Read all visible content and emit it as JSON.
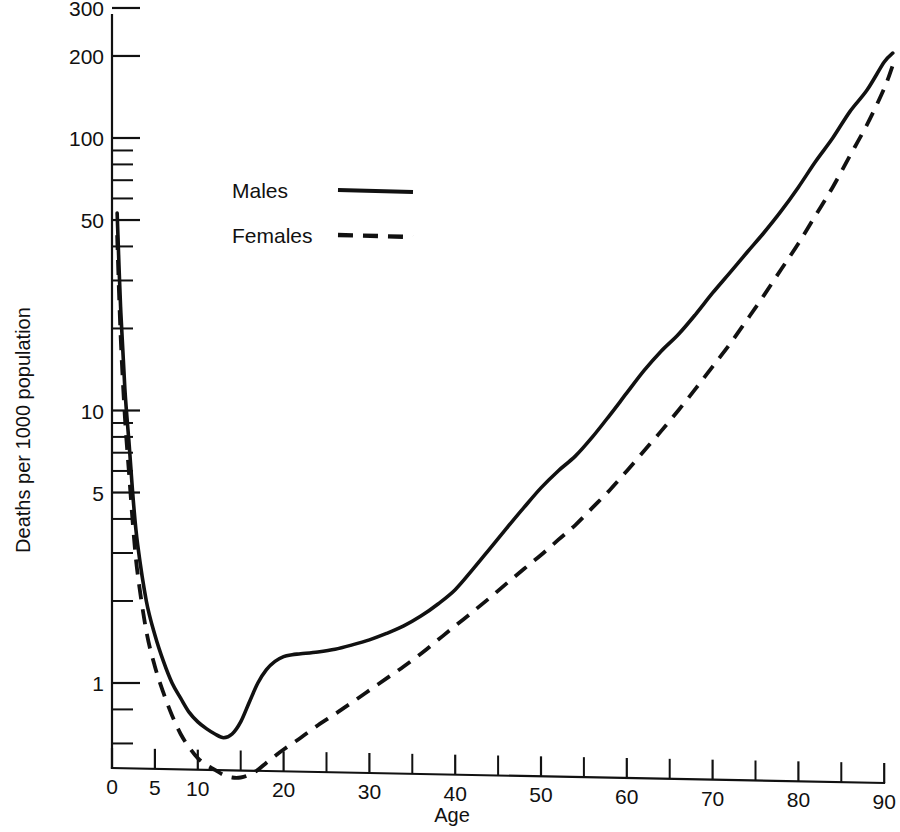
{
  "chart_data": {
    "type": "line",
    "title": "",
    "xlabel": "Age",
    "ylabel": "Deaths per 1000 population",
    "yscale": "log",
    "xscale": "linear",
    "xlim": [
      0,
      91
    ],
    "ylim": [
      0.4,
      330
    ],
    "grid": false,
    "legend_position": "upper-left-inside",
    "x_ticks_major": [
      0,
      5,
      10,
      20,
      30,
      40,
      50,
      60,
      70,
      80,
      90
    ],
    "x_tick_labels": [
      "0",
      "5",
      "10",
      "20",
      "30",
      "40",
      "50",
      "60",
      "70",
      "80",
      "90"
    ],
    "x_ticks_minor": [
      15,
      25,
      35,
      45,
      55,
      65,
      75,
      85
    ],
    "y_ticks_major": [
      1,
      5,
      10,
      50,
      100,
      200,
      300
    ],
    "y_tick_labels": [
      "1",
      "5",
      "10",
      "50",
      "100",
      "200",
      "300"
    ],
    "y_ticks_minor": [
      0.6,
      0.8,
      2,
      3,
      4,
      6,
      7,
      8,
      9,
      20,
      30,
      40,
      60,
      70,
      80,
      90
    ],
    "series": [
      {
        "name": "Males",
        "style": "solid",
        "color": "#111111",
        "x": [
          0.6,
          1,
          1.5,
          2,
          2.5,
          3,
          4,
          5,
          6,
          7,
          8,
          9,
          10,
          11,
          12,
          13,
          14,
          15,
          16,
          17,
          18,
          19,
          20,
          21,
          22,
          24,
          26,
          28,
          30,
          32,
          34,
          36,
          38,
          40,
          42,
          44,
          46,
          48,
          50,
          52,
          54,
          56,
          58,
          60,
          62,
          64,
          66,
          68,
          70,
          72,
          74,
          76,
          78,
          80,
          82,
          84,
          86,
          88,
          90,
          91
        ],
        "y": [
          53,
          24,
          12,
          7.5,
          4.6,
          3.2,
          2.0,
          1.5,
          1.2,
          1.0,
          0.88,
          0.78,
          0.72,
          0.68,
          0.65,
          0.63,
          0.65,
          0.72,
          0.85,
          1.0,
          1.12,
          1.2,
          1.25,
          1.27,
          1.28,
          1.3,
          1.33,
          1.38,
          1.44,
          1.52,
          1.62,
          1.76,
          1.95,
          2.2,
          2.6,
          3.1,
          3.7,
          4.4,
          5.2,
          6.0,
          6.8,
          8.0,
          9.6,
          11.6,
          14.0,
          16.5,
          19.0,
          22.5,
          27.0,
          32.0,
          38.0,
          45.0,
          54.0,
          66.0,
          82.0,
          100.0,
          125.0,
          150.0,
          190.0,
          205.0
        ]
      },
      {
        "name": "Females",
        "style": "dashed",
        "color": "#111111",
        "x": [
          0.6,
          1,
          1.5,
          2,
          2.5,
          3,
          4,
          5,
          6,
          7,
          8,
          9,
          10,
          11,
          12,
          13,
          14,
          15,
          16,
          17,
          18,
          19,
          20,
          22,
          24,
          26,
          28,
          30,
          32,
          34,
          36,
          38,
          40,
          42,
          44,
          46,
          48,
          50,
          52,
          54,
          56,
          58,
          60,
          62,
          64,
          66,
          68,
          70,
          72,
          74,
          76,
          78,
          80,
          82,
          84,
          86,
          88,
          90,
          91
        ],
        "y": [
          44,
          19,
          9.5,
          5.8,
          3.6,
          2.5,
          1.55,
          1.15,
          0.92,
          0.76,
          0.65,
          0.58,
          0.53,
          0.5,
          0.48,
          0.46,
          0.45,
          0.45,
          0.46,
          0.48,
          0.51,
          0.54,
          0.57,
          0.63,
          0.7,
          0.77,
          0.85,
          0.94,
          1.04,
          1.15,
          1.28,
          1.44,
          1.62,
          1.82,
          2.05,
          2.32,
          2.62,
          2.95,
          3.35,
          3.8,
          4.4,
          5.1,
          6.0,
          7.1,
          8.4,
          10.0,
          12.0,
          14.5,
          17.5,
          21.5,
          26.5,
          33.0,
          41.0,
          52.0,
          66.0,
          86.0,
          112.0,
          152.0,
          185.0
        ]
      }
    ],
    "legend": [
      {
        "label": "Males",
        "style": "solid"
      },
      {
        "label": "Females",
        "style": "dashed"
      }
    ]
  }
}
